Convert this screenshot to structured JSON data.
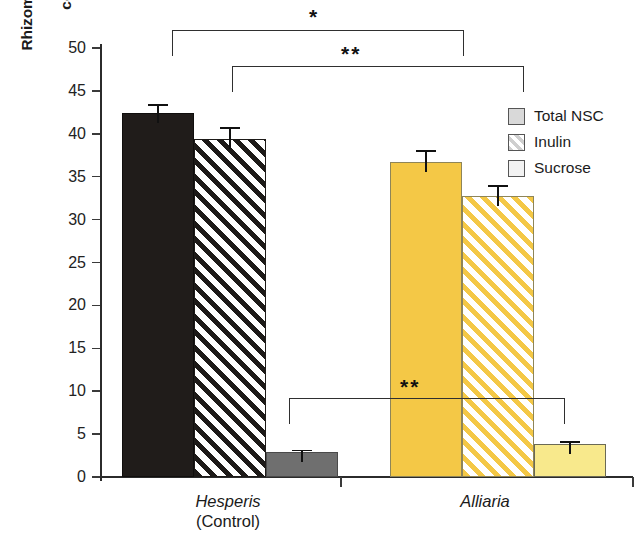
{
  "chart_data": {
    "type": "bar",
    "title": "",
    "xlabel": "",
    "ylabel": "Rhizome carbohydrate content (%)",
    "ylabel_lines": [
      "Rhizome carbohydrate",
      "content (%)"
    ],
    "ylim": [
      0,
      50
    ],
    "ytick_values": [
      0,
      5,
      10,
      15,
      20,
      25,
      30,
      35,
      40,
      45,
      50
    ],
    "ytick_labels": [
      "0",
      "5",
      "10",
      "15",
      "20",
      "25",
      "30",
      "35",
      "40",
      "45",
      "50"
    ],
    "grid": false,
    "legend_position": "top-right",
    "categories": [
      "Hesperis",
      "Alliaria"
    ],
    "category_sublabels": [
      "(Control)",
      ""
    ],
    "series": [
      {
        "name": "Total NSC",
        "values": [
          42.4,
          36.7
        ],
        "errors": [
          1.1,
          1.4
        ],
        "swatch": "gray-fill"
      },
      {
        "name": "Inulin",
        "values": [
          39.4,
          32.7
        ],
        "errors": [
          1.4,
          1.3
        ],
        "swatch": "hatched"
      },
      {
        "name": "Sucrose",
        "values": [
          2.9,
          3.9
        ],
        "errors": [
          0.3,
          0.3
        ],
        "swatch": "white-fill"
      }
    ],
    "annotations": [
      {
        "id": "bracket-total-nsc",
        "text": "*",
        "compares": [
          "Hesperis Total NSC",
          "Alliaria Total NSC"
        ]
      },
      {
        "id": "bracket-inulin",
        "text": "**",
        "compares": [
          "Hesperis Inulin",
          "Alliaria Inulin"
        ]
      },
      {
        "id": "bracket-sucrose",
        "text": "**",
        "compares": [
          "Hesperis Sucrose",
          "Alliaria Sucrose"
        ]
      }
    ]
  },
  "legend": {
    "items": [
      {
        "label": "Total NSC"
      },
      {
        "label": "Inulin"
      },
      {
        "label": "Sucrose"
      }
    ]
  },
  "axis": {
    "y_title_line1": "Rhizome carbohydrate",
    "y_title_line2": "content (%)",
    "ticks": [
      "50",
      "45",
      "40",
      "35",
      "30",
      "25",
      "20",
      "15",
      "10",
      "5",
      "0"
    ]
  },
  "groups": [
    {
      "name": "Hesperis",
      "sub": "(Control)"
    },
    {
      "name": "Alliaria",
      "sub": ""
    }
  ],
  "significance": {
    "top": "*",
    "middle": "**",
    "bottom": "**"
  }
}
